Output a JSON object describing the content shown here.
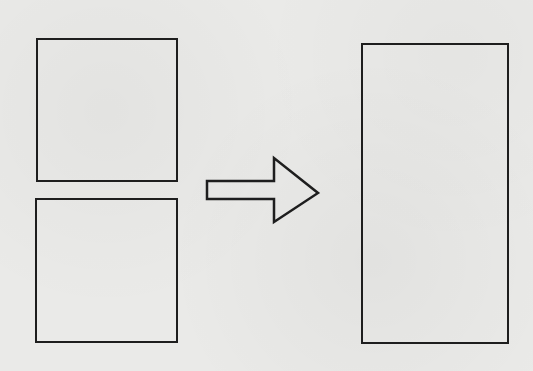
{
  "diagram": {
    "stroke_color": "#1e1e1e",
    "background_color": "#eaeae8",
    "shapes": {
      "top_left_square": {
        "x": 36,
        "y": 38,
        "width": 142,
        "height": 144
      },
      "bottom_left_square": {
        "x": 35,
        "y": 198,
        "width": 143,
        "height": 145
      },
      "right_rectangle": {
        "x": 361,
        "y": 43,
        "width": 148,
        "height": 301
      }
    },
    "arrow": {
      "direction": "right",
      "points": "207,181 274,181 274,158 318,193 274,222 274,199 207,199"
    }
  }
}
